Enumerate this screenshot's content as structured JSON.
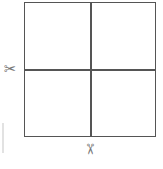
{
  "diagram": {
    "title": "",
    "shape": "square divided into four equal quadrants",
    "cut_lines": [
      {
        "orientation": "horizontal",
        "marker": "scissors-icon",
        "position": "left"
      },
      {
        "orientation": "vertical",
        "marker": "scissors-icon",
        "position": "bottom"
      }
    ],
    "icons": {
      "scissors": "✂"
    },
    "colors": {
      "line": "#555555",
      "icon": "#777777",
      "background": "#ffffff"
    }
  }
}
